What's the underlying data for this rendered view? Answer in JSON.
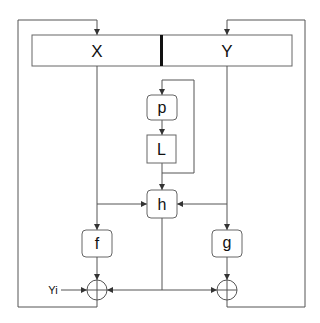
{
  "diagram": {
    "register": {
      "left_label": "X",
      "right_label": "Y"
    },
    "nodes": {
      "p": "p",
      "L": "L",
      "h": "h",
      "f": "f",
      "g": "g"
    },
    "input_label": "Yi",
    "operators": [
      "xor",
      "xor"
    ],
    "colors": {
      "line": "#555555",
      "box_border": "#666666",
      "text": "#111111",
      "background": "#ffffff"
    }
  }
}
